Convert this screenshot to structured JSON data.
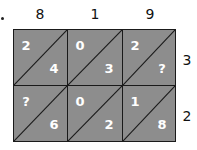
{
  "diagram": {
    "type": "lattice-multiplication",
    "marker": "bullet",
    "top_labels": [
      "8",
      "1",
      "9"
    ],
    "side_labels": [
      "3",
      "2"
    ],
    "cells": [
      [
        {
          "tens": "2",
          "ones": "4"
        },
        {
          "tens": "0",
          "ones": "3"
        },
        {
          "tens": "2",
          "ones": "?"
        }
      ],
      [
        {
          "tens": "?",
          "ones": "6"
        },
        {
          "tens": "0",
          "ones": "2"
        },
        {
          "tens": "1",
          "ones": "8"
        }
      ]
    ],
    "colors": {
      "cell_fill": "#8d8d8d",
      "digit": "#ffffff",
      "lines": "#1a1a1a",
      "labels": "#111111"
    }
  }
}
